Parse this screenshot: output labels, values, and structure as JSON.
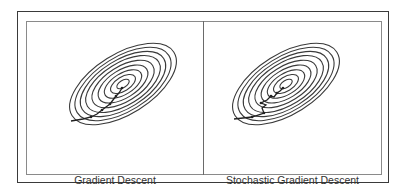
{
  "figure": {
    "panels": [
      {
        "id": "gd",
        "caption": "Gradient Descent",
        "path_type": "smooth zig-zag toward minimum"
      },
      {
        "id": "sgd",
        "caption": "Stochastic Gradient Descent",
        "path_type": "noisy zig-zag toward minimum"
      }
    ],
    "colors": {
      "contour": "#3a3a3a",
      "frame_outer": "#3a3a3a",
      "frame_inner": "#8a8a8a",
      "background": "#ffffff"
    }
  }
}
